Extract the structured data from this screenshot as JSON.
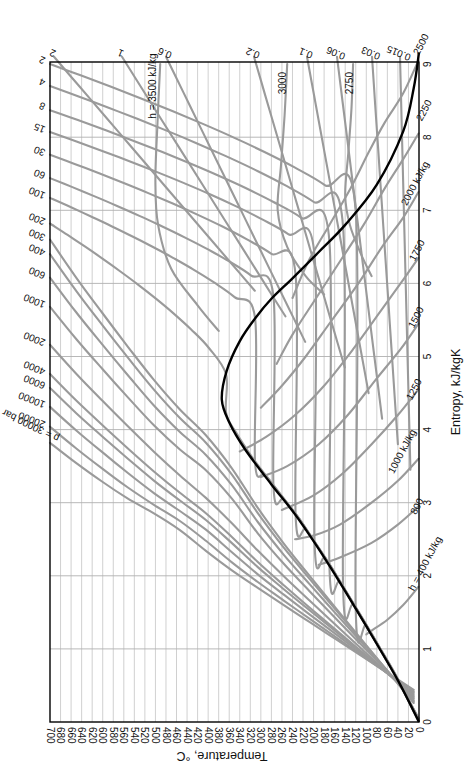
{
  "chart_data": {
    "type": "line",
    "orientation": "rotated 90° clockwise (temperature axis runs along bottom, reversed; entropy axis runs along right side)",
    "xlabel": "Entropy, kJ/kgK",
    "ylabel": "Temperature, °C",
    "xlim": [
      0,
      9
    ],
    "ylim": [
      0,
      700
    ],
    "grid": true,
    "legend": "none (curves labeled inline)",
    "x_ticks": [
      "0",
      "1",
      "2",
      "3",
      "4",
      "5",
      "6",
      "7",
      "8",
      "9"
    ],
    "y_ticks": [
      "0",
      "20",
      "40",
      "60",
      "80",
      "100",
      "120",
      "140",
      "160",
      "180",
      "200",
      "220",
      "240",
      "260",
      "280",
      "300",
      "320",
      "340",
      "360",
      "380",
      "400",
      "420",
      "440",
      "460",
      "480",
      "500",
      "520",
      "540",
      "560",
      "580",
      "600",
      "620",
      "640",
      "660",
      "680",
      "700"
    ],
    "saturation_dome": {
      "name": "Saturation curve",
      "color": "#000000",
      "points": [
        [
          0.0,
          0
        ],
        [
          0.57,
          40
        ],
        [
          1.31,
          100
        ],
        [
          2.14,
          170
        ],
        [
          2.79,
          230
        ],
        [
          3.25,
          280
        ],
        [
          3.73,
          330
        ],
        [
          4.1,
          360
        ],
        [
          4.41,
          374
        ],
        [
          4.8,
          365
        ],
        [
          5.21,
          340
        ],
        [
          5.53,
          310
        ],
        [
          5.79,
          280
        ],
        [
          6.07,
          240
        ],
        [
          6.43,
          190
        ],
        [
          6.8,
          140
        ],
        [
          7.35,
          80
        ],
        [
          8.08,
          30
        ],
        [
          8.67,
          10
        ],
        [
          9.16,
          0
        ]
      ]
    },
    "isobars": {
      "unit": "bar",
      "labels": [
        "2",
        "4",
        "8",
        "15",
        "30",
        "60",
        "100",
        "200",
        "300",
        "400",
        "600",
        "1000",
        "2000",
        "4000",
        "6000",
        "10000",
        "20000",
        "p = 30000 bar"
      ],
      "values": [
        2,
        4,
        8,
        15,
        30,
        60,
        100,
        200,
        300,
        400,
        600,
        1000,
        2000,
        4000,
        6000,
        10000,
        20000,
        30000
      ],
      "entropy_at_700C": [
        9.0,
        8.7,
        8.37,
        8.07,
        7.76,
        7.44,
        7.17,
        6.82,
        6.6,
        6.4,
        6.08,
        5.68,
        5.16,
        4.76,
        4.57,
        4.31,
        4.04,
        3.82
      ]
    },
    "isochores": {
      "unit": "m3/kg",
      "labels": [
        "2",
        "1",
        "0.6",
        "0.2",
        "0.1",
        "0.06",
        "0.03",
        "0.015"
      ],
      "values": [
        2,
        1,
        0.6,
        0.2,
        0.1,
        0.06,
        0.03,
        0.015
      ]
    },
    "isenthalps": {
      "unit": "kJ/kg",
      "labels": [
        "h = 400 kJ/kg",
        "800",
        "1000 kJ/kg",
        "1250",
        "1500",
        "1750",
        "2000 kJ/kg",
        "2250",
        "2500",
        "2750",
        "3000",
        "h = 3500 kJ/kg"
      ],
      "values": [
        400,
        800,
        1000,
        1250,
        1500,
        1750,
        2000,
        2250,
        2500,
        2750,
        3000,
        3500
      ]
    }
  },
  "axes": {
    "temperature_title": "Temperature, °C",
    "entropy_title": "Entropy, kJ/kgK",
    "temperature_ticks": [
      "0",
      "20",
      "40",
      "60",
      "80",
      "100",
      "120",
      "140",
      "160",
      "180",
      "200",
      "220",
      "240",
      "260",
      "280",
      "300",
      "320",
      "340",
      "360",
      "380",
      "400",
      "420",
      "440",
      "460",
      "480",
      "500",
      "520",
      "540",
      "560",
      "580",
      "600",
      "620",
      "640",
      "660",
      "680",
      "700"
    ],
    "entropy_ticks": [
      "0",
      "1",
      "2",
      "3",
      "4",
      "5",
      "6",
      "7",
      "8",
      "9"
    ]
  },
  "labels": {
    "isobar_labels": [
      {
        "text": "2",
        "y": 62
      },
      {
        "text": "4",
        "y": 84
      },
      {
        "text": "8",
        "y": 108
      },
      {
        "text": "15",
        "y": 131
      },
      {
        "text": "30",
        "y": 154
      },
      {
        "text": "60",
        "y": 177
      },
      {
        "text": "100",
        "y": 197
      },
      {
        "text": "200",
        "y": 223
      },
      {
        "text": "300",
        "y": 239
      },
      {
        "text": "400",
        "y": 254
      },
      {
        "text": "600",
        "y": 277
      },
      {
        "text": "1000",
        "y": 306
      },
      {
        "text": "2000",
        "y": 344
      },
      {
        "text": "4000",
        "y": 373
      },
      {
        "text": "6000",
        "y": 387
      },
      {
        "text": "10000",
        "y": 406
      },
      {
        "text": "20000",
        "y": 426
      },
      {
        "text": "p = 30000 bar",
        "y": 442
      }
    ],
    "isochore_labels": [
      {
        "text": "2",
        "x": 54
      },
      {
        "text": "1",
        "x": 122
      },
      {
        "text": "0.6",
        "x": 166
      },
      {
        "text": "0.2",
        "x": 254
      },
      {
        "text": "0.1",
        "x": 307
      },
      {
        "text": "0.06",
        "x": 337
      },
      {
        "text": "0.03",
        "x": 372
      },
      {
        "text": "0.015",
        "x": 400
      }
    ],
    "enthalpy_labels": {
      "h3500": "h = 3500 kJ/kg",
      "h3000": "3000",
      "h2750": "2750",
      "h2500": "2500",
      "h2250": "2250",
      "h2000": "2000 kJ/kg",
      "h1750": "1750",
      "h1500": "1500",
      "h1250": "1250",
      "h1000": "1000 kJ/kg",
      "h800": "800",
      "h400": "h = 400 kJ/kg"
    }
  },
  "colors": {
    "isolines": "#9a9a9a",
    "saturation_curve": "#000000",
    "grid": "#c4c4c4",
    "frame": "#000000",
    "background": "#ffffff"
  }
}
